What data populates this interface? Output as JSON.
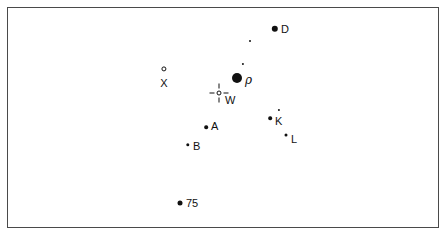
{
  "chart_data": {
    "type": "scatter",
    "title": "",
    "subtitle": "",
    "xlabel": "",
    "ylabel": "",
    "grid": false,
    "legend": null,
    "xlim": [
      0,
      447
    ],
    "ylim": [
      0,
      237
    ],
    "frame": {
      "left": 7,
      "top": 7,
      "width": 432,
      "height": 221,
      "border_color": "#4a4a4a",
      "background_color": "#ffffff"
    },
    "marker_color": "#111111",
    "points": [
      {
        "id": "D",
        "label": "D",
        "x": 275,
        "y": 29,
        "size": 6.4,
        "style": "filled",
        "label_dx": 6,
        "label_dy": 0,
        "label_pos": "right"
      },
      {
        "id": "dot1",
        "label": "",
        "x": 250,
        "y": 41,
        "size": 2.0,
        "style": "filled",
        "label_dx": 0,
        "label_dy": 0,
        "label_pos": "none"
      },
      {
        "id": "dot2",
        "label": "",
        "x": 243,
        "y": 64,
        "size": 2.2,
        "style": "filled",
        "label_dx": 0,
        "label_dy": 0,
        "label_pos": "none"
      },
      {
        "id": "rho",
        "label": "ρ",
        "x": 237,
        "y": 78,
        "size": 10.0,
        "style": "filled",
        "label_dx": 8,
        "label_dy": 2,
        "label_pos": "right"
      },
      {
        "id": "X",
        "label": "X",
        "x": 164,
        "y": 69,
        "size": 5.2,
        "style": "open",
        "label_dx": 0,
        "label_dy": 9,
        "label_pos": "below"
      },
      {
        "id": "dot3",
        "label": "",
        "x": 279,
        "y": 110,
        "size": 2.2,
        "style": "filled",
        "label_dx": 0,
        "label_dy": 0,
        "label_pos": "none"
      },
      {
        "id": "K",
        "label": "K",
        "x": 270,
        "y": 118,
        "size": 3.6,
        "style": "filled",
        "label_dx": 5,
        "label_dy": 3,
        "label_pos": "right"
      },
      {
        "id": "A",
        "label": "A",
        "x": 206,
        "y": 127,
        "size": 3.6,
        "style": "filled",
        "label_dx": 5,
        "label_dy": -1,
        "label_pos": "right"
      },
      {
        "id": "L",
        "label": "L",
        "x": 286,
        "y": 135,
        "size": 3.0,
        "style": "filled",
        "label_dx": 5,
        "label_dy": 4,
        "label_pos": "right"
      },
      {
        "id": "B",
        "label": "B",
        "x": 188,
        "y": 145,
        "size": 3.4,
        "style": "filled",
        "label_dx": 5,
        "label_dy": 1,
        "label_pos": "right"
      },
      {
        "id": "75",
        "label": "75",
        "x": 180,
        "y": 203,
        "size": 5.0,
        "style": "filled",
        "label_dx": 6,
        "label_dy": 0,
        "label_pos": "right"
      }
    ],
    "reticle": {
      "id": "W",
      "label": "W",
      "x": 219,
      "y": 93,
      "label_dx": 6,
      "label_dy": 7,
      "style": "crosshair-open-circle"
    }
  }
}
